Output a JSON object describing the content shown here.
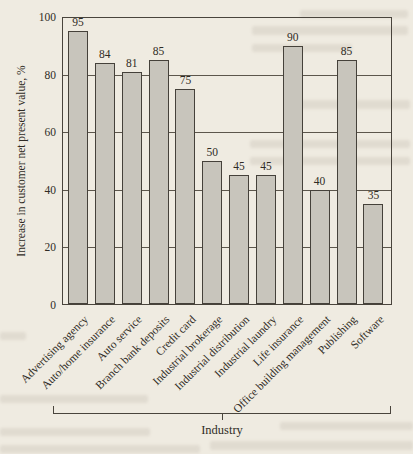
{
  "page": {
    "background": "#efebe1"
  },
  "figure": {
    "y_axis_title": "Increase in customer net present value, %",
    "group_label": "Industry"
  },
  "chart_data": {
    "type": "bar",
    "title": "",
    "xlabel": "Industry",
    "ylabel": "Increase in customer net present value, %",
    "ylim": [
      0,
      100
    ],
    "yticks": [
      0,
      20,
      40,
      60,
      80,
      100
    ],
    "grid": true,
    "legend": false,
    "value_labels_shown": true,
    "bar_fill": "#c8c5bc",
    "bar_border": "#45413a",
    "categories": [
      "Advertising agency",
      "Auto/home insurance",
      "Auto service",
      "Branch bank deposits",
      "Credit card",
      "Industrial brokerage",
      "Industrial distribution",
      "Industrial laundry",
      "Life insurance",
      "Office building management",
      "Publishing",
      "Software"
    ],
    "values": [
      95,
      84,
      81,
      85,
      75,
      50,
      45,
      45,
      90,
      40,
      85,
      35
    ]
  }
}
